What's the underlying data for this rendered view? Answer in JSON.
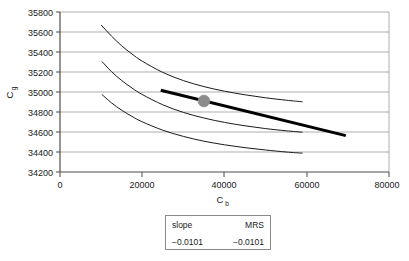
{
  "chart_data": {
    "type": "line",
    "title": "",
    "xlabel": "C_b",
    "ylabel": "C_g",
    "xlabel_base": "C",
    "xlabel_sub": "b",
    "ylabel_base": "C",
    "ylabel_sub": "g",
    "xlim": [
      0,
      80000
    ],
    "ylim": [
      34200,
      35800
    ],
    "xticks": [
      0,
      20000,
      40000,
      60000,
      80000
    ],
    "xtick_labels": [
      "0",
      "20000",
      "40000",
      "60000",
      "80000"
    ],
    "yticks": [
      34200,
      34400,
      34600,
      34800,
      35000,
      35200,
      35400,
      35600,
      35800
    ],
    "ytick_labels": [
      "34200",
      "34400",
      "34600",
      "34800",
      "35000",
      "35200",
      "35400",
      "35600",
      "35800"
    ],
    "grid": "horizontal",
    "legend_position": "below-plot-table",
    "series": [
      {
        "name": "indifference-curve-upper",
        "style": "thin",
        "color": "#1a1a1a",
        "points": [
          [
            10000,
            35670
          ],
          [
            12500,
            35560
          ],
          [
            15000,
            35462
          ],
          [
            17500,
            35380
          ],
          [
            20000,
            35308
          ],
          [
            25000,
            35196
          ],
          [
            30000,
            35114
          ],
          [
            35000,
            35054
          ],
          [
            40000,
            35008
          ],
          [
            45000,
            34972
          ],
          [
            50000,
            34942
          ],
          [
            55000,
            34918
          ],
          [
            59000,
            34902
          ]
        ]
      },
      {
        "name": "indifference-curve-middle",
        "style": "thin",
        "color": "#1a1a1a",
        "points": [
          [
            10200,
            35305
          ],
          [
            12500,
            35205
          ],
          [
            15000,
            35115
          ],
          [
            17500,
            35040
          ],
          [
            20000,
            34975
          ],
          [
            25000,
            34872
          ],
          [
            30000,
            34796
          ],
          [
            35000,
            34740
          ],
          [
            40000,
            34696
          ],
          [
            45000,
            34662
          ],
          [
            50000,
            34634
          ],
          [
            55000,
            34612
          ],
          [
            59000,
            34598
          ]
        ]
      },
      {
        "name": "indifference-curve-lower",
        "style": "thin",
        "color": "#1a1a1a",
        "points": [
          [
            10200,
            34975
          ],
          [
            12500,
            34892
          ],
          [
            15000,
            34818
          ],
          [
            17500,
            34756
          ],
          [
            20000,
            34702
          ],
          [
            25000,
            34618
          ],
          [
            30000,
            34556
          ],
          [
            35000,
            34508
          ],
          [
            40000,
            34472
          ],
          [
            45000,
            34443
          ],
          [
            50000,
            34420
          ],
          [
            55000,
            34400
          ],
          [
            59000,
            34388
          ]
        ]
      },
      {
        "name": "budget-line",
        "style": "thick",
        "color": "#000000",
        "points": [
          [
            24500,
            35018
          ],
          [
            69500,
            34564
          ]
        ]
      }
    ],
    "markers": [
      {
        "name": "tangency-point",
        "x": 35000,
        "y": 34910,
        "color": "#8c8c8c",
        "shape": "circle",
        "radius": 6
      }
    ],
    "table": {
      "headers": [
        "slope",
        "MRS"
      ],
      "values": [
        "−0.0101",
        "−0.0101"
      ]
    }
  }
}
